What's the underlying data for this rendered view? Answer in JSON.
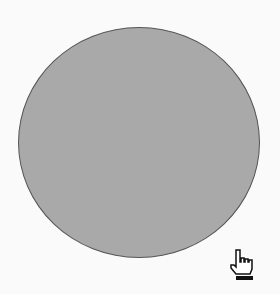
{
  "canvas": {
    "shape": "circle",
    "fill_color": "#a9a9a9",
    "stroke_color": "#555555",
    "background_color": "#fafafa"
  },
  "cursor": {
    "icon": "hand-pointer-icon",
    "x": 228,
    "y": 248
  }
}
